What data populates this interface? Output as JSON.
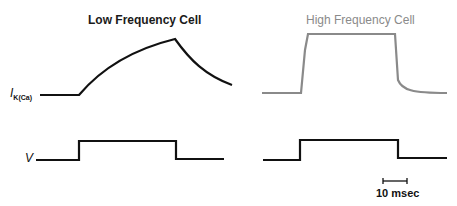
{
  "panels": [
    {
      "title": "Low Frequency Cell",
      "title_color": "#1a1a1a",
      "trace_color": "#111111"
    },
    {
      "title": "High Frequency Cell",
      "title_color": "#8a8a8a",
      "trace_color": "#8a8a8a"
    }
  ],
  "labels": {
    "current": "I",
    "current_sub": "K(Ca)",
    "voltage": "V"
  },
  "scale_bar": {
    "label": "10 msec"
  }
}
